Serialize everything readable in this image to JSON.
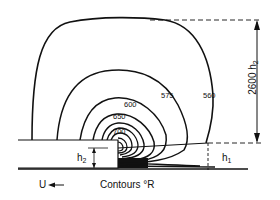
{
  "diagram": {
    "type": "contour-diagram",
    "contour_levels": [
      {
        "value": "560",
        "label": "560"
      },
      {
        "value": "575",
        "label": "575"
      },
      {
        "value": "600",
        "label": "600"
      },
      {
        "value": "650",
        "label": "650"
      },
      {
        "value": "700",
        "label": "700"
      }
    ],
    "labels": {
      "height_total": "2600",
      "height_total_var": "h",
      "height_total_sub": "2",
      "h1_var": "h",
      "h1_sub": "1",
      "h2_var": "h",
      "h2_sub": "2",
      "flow_velocity": "U",
      "flow_arrow": "◀—",
      "legend": "Contours °R"
    },
    "colors": {
      "line": "#111111",
      "background": "#ffffff"
    }
  }
}
